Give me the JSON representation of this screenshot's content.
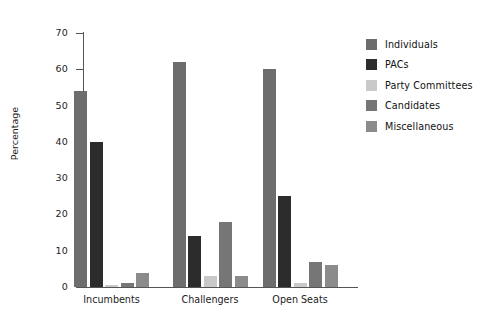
{
  "chart_data": {
    "type": "bar",
    "title": "",
    "subtitle": "",
    "xlabel": "",
    "ylabel": "Percentage",
    "ylim": [
      0,
      70
    ],
    "yticks": [
      0,
      10,
      20,
      30,
      40,
      50,
      60,
      70
    ],
    "ytick_labels": [
      "0",
      "10",
      "20",
      "30",
      "40",
      "50",
      "60",
      "70"
    ],
    "grid": false,
    "legend_position": "right",
    "categories": [
      "Incumbents",
      "Challengers",
      "Open Seats"
    ],
    "series": [
      {
        "name": "Individuals",
        "color": "#6d6d6d",
        "values": [
          54,
          62,
          60
        ]
      },
      {
        "name": "PACs",
        "color": "#2c2c2c",
        "values": [
          40,
          14,
          25
        ]
      },
      {
        "name": "Party Committees",
        "color": "#c9c9c9",
        "values": [
          0.5,
          3,
          1
        ]
      },
      {
        "name": "Candidates",
        "color": "#767676",
        "values": [
          1,
          18,
          7
        ]
      },
      {
        "name": "Miscellaneous",
        "color": "#8b8b8b",
        "values": [
          4,
          3,
          6
        ]
      }
    ]
  },
  "axis": {
    "y_title": "Percentage",
    "axis_color": "#555555"
  },
  "legend": {
    "entries": [
      {
        "label": "Individuals",
        "color": "#6d6d6d"
      },
      {
        "label": "PACs",
        "color": "#2c2c2c"
      },
      {
        "label": "Party Committees",
        "color": "#c9c9c9"
      },
      {
        "label": "Candidates",
        "color": "#767676"
      },
      {
        "label": "Miscellaneous",
        "color": "#8b8b8b"
      }
    ]
  }
}
